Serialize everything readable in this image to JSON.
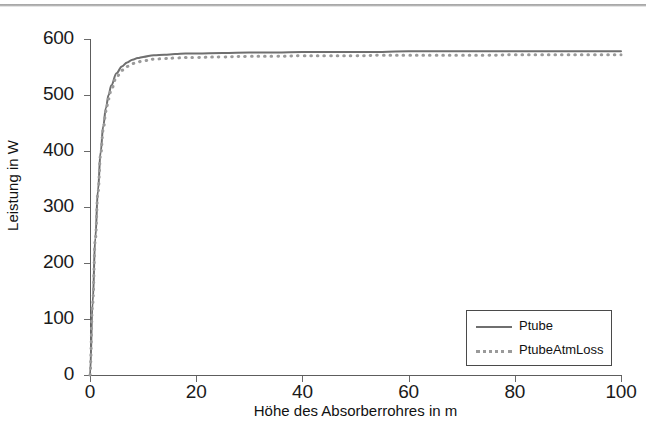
{
  "chart_data": {
    "type": "line",
    "title": "",
    "xlabel": "Höhe des Absorberrohres in m",
    "ylabel": "Leistung in W",
    "xlim": [
      0,
      100
    ],
    "ylim": [
      0,
      600
    ],
    "xticks": [
      "0",
      "20",
      "40",
      "60",
      "80",
      "100"
    ],
    "xtick_values": [
      0,
      20,
      40,
      60,
      80,
      100
    ],
    "yticks": [
      "0",
      "100",
      "200",
      "300",
      "400",
      "500",
      "600"
    ],
    "ytick_values": [
      0,
      100,
      200,
      300,
      400,
      500,
      600
    ],
    "grid": false,
    "legend_position": "lower right",
    "series": [
      {
        "name": "Ptube",
        "style": "solid",
        "color": "#6f6f6f",
        "x": [
          0,
          0.5,
          1,
          1.5,
          2,
          2.5,
          3,
          3.5,
          4,
          5,
          6,
          7,
          8,
          9,
          10,
          12,
          14,
          16,
          18,
          20,
          25,
          30,
          35,
          40,
          45,
          50,
          55,
          60,
          65,
          70,
          75,
          80,
          85,
          90,
          95,
          100
        ],
        "values": [
          0,
          130,
          245,
          330,
          398,
          445,
          477,
          500,
          517,
          539,
          551,
          558,
          563,
          566,
          568,
          571,
          572,
          573,
          574,
          574,
          575,
          576,
          576,
          577,
          577,
          577,
          577,
          578,
          578,
          578,
          578,
          578,
          578,
          578,
          578,
          578
        ]
      },
      {
        "name": "PtubeAtmLoss",
        "style": "dotted",
        "color": "#9a9a9a",
        "x": [
          0,
          0.5,
          1,
          1.5,
          2,
          2.5,
          3,
          3.5,
          4,
          5,
          6,
          7,
          8,
          9,
          10,
          12,
          14,
          16,
          18,
          20,
          25,
          30,
          35,
          40,
          45,
          50,
          55,
          60,
          65,
          70,
          75,
          80,
          85,
          90,
          95,
          100
        ],
        "values": [
          0,
          128,
          242,
          326,
          393,
          439,
          471,
          493,
          510,
          532,
          544,
          551,
          556,
          559,
          561,
          564,
          565,
          566,
          567,
          567,
          568,
          569,
          569,
          570,
          570,
          570,
          571,
          571,
          571,
          571,
          571,
          572,
          572,
          572,
          572,
          572
        ]
      }
    ]
  },
  "legend": {
    "entries": [
      {
        "label": "Ptube"
      },
      {
        "label": "PtubeAtmLoss"
      }
    ]
  },
  "colors": {
    "axis": "#5d5d5d",
    "text": "#111111",
    "series_solid": "#6f6f6f",
    "series_dotted": "#9a9a9a"
  }
}
